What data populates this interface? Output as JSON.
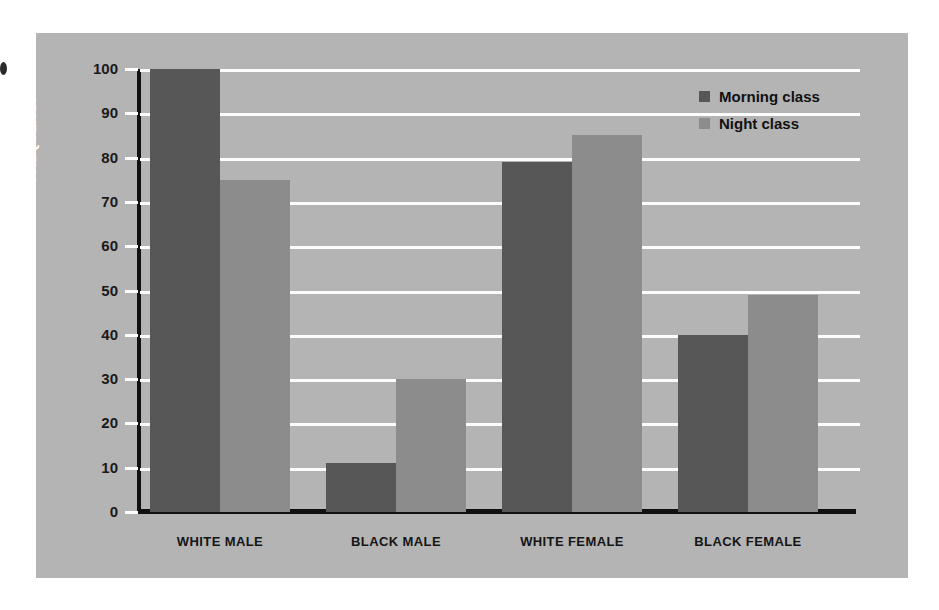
{
  "chart_data": {
    "type": "bar",
    "title": "",
    "xlabel": "",
    "ylabel": "FREQUENCY",
    "categories": [
      "WHITE MALE",
      "BLACK MALE",
      "WHITE FEMALE",
      "BLACK FEMALE"
    ],
    "series": [
      {
        "name": "Morning class",
        "color": "#575757",
        "values": [
          100,
          11,
          79,
          40
        ]
      },
      {
        "name": "Night class",
        "color": "#8c8c8c",
        "values": [
          75,
          30,
          85,
          49
        ]
      }
    ],
    "ylim": [
      0,
      100
    ],
    "ytick_labels": [
      "0",
      "10",
      "20",
      "30",
      "40",
      "50",
      "60",
      "70",
      "80",
      "90",
      "100"
    ],
    "ytick_values": [
      0,
      10,
      20,
      30,
      40,
      50,
      60,
      70,
      80,
      90,
      100
    ],
    "grid": true,
    "grid_color": "#fdfdfd",
    "legend_position": "top-right",
    "plot_background": "#b4b4b4",
    "axis_color": "#111111"
  }
}
